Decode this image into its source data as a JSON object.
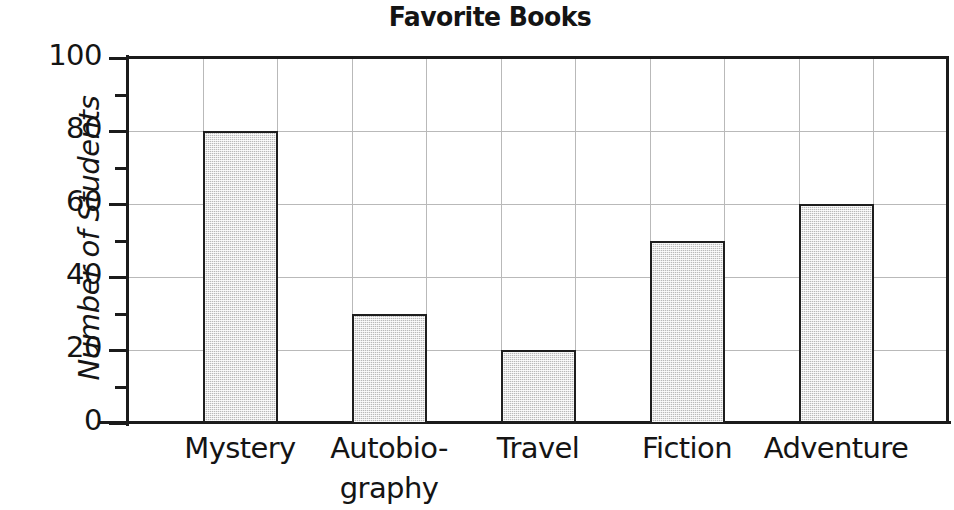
{
  "chart_data": {
    "type": "bar",
    "title": "Favorite Books",
    "xlabel": "",
    "ylabel": "Number of Students",
    "categories": [
      "Mystery",
      "Autobio-\ngraphy",
      "Travel",
      "Fiction",
      "Adventure"
    ],
    "category_names": [
      "Mystery",
      "Autobiography",
      "Travel",
      "Fiction",
      "Adventure"
    ],
    "values": [
      80,
      30,
      20,
      50,
      60
    ],
    "ylim": [
      0,
      100
    ],
    "y_major_ticks": [
      0,
      20,
      40,
      60,
      80,
      100
    ],
    "y_minor_ticks": [
      10,
      30,
      50,
      70,
      90
    ],
    "y_tick_labels": [
      "0",
      "20",
      "40",
      "60",
      "80",
      "100"
    ],
    "gridlines_horizontal": [
      20,
      40,
      60,
      80
    ],
    "grid": true,
    "legend": "none",
    "bar_fill_color": "#cbcbcb",
    "bar_edge_color": "#1e1e1e",
    "axis_color": "#1b1b1b",
    "grid_color": "#b9b9b9",
    "background_color": "#ffffff"
  }
}
